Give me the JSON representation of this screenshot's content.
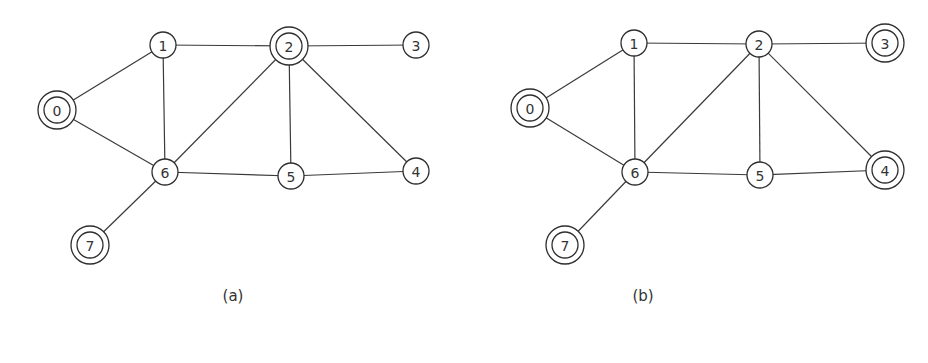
{
  "diagrams": [
    {
      "caption": "(a)",
      "caption_pos": [
        233,
        297
      ],
      "nodes": [
        {
          "id": "0",
          "x": 57,
          "y": 110,
          "double": true
        },
        {
          "id": "1",
          "x": 163,
          "y": 45,
          "double": false
        },
        {
          "id": "2",
          "x": 289,
          "y": 46,
          "double": true
        },
        {
          "id": "3",
          "x": 416,
          "y": 45,
          "double": false
        },
        {
          "id": "4",
          "x": 416,
          "y": 171,
          "double": false
        },
        {
          "id": "5",
          "x": 291,
          "y": 176,
          "double": false
        },
        {
          "id": "6",
          "x": 165,
          "y": 172,
          "double": false
        },
        {
          "id": "7",
          "x": 90,
          "y": 245,
          "double": true
        }
      ],
      "edges": [
        [
          "0",
          "1"
        ],
        [
          "0",
          "6"
        ],
        [
          "1",
          "2"
        ],
        [
          "1",
          "6"
        ],
        [
          "2",
          "3"
        ],
        [
          "2",
          "6"
        ],
        [
          "2",
          "5"
        ],
        [
          "2",
          "4"
        ],
        [
          "6",
          "5"
        ],
        [
          "5",
          "4"
        ],
        [
          "6",
          "7"
        ]
      ]
    },
    {
      "caption": "(b)",
      "caption_pos": [
        643,
        297
      ],
      "nodes": [
        {
          "id": "0",
          "x": 530,
          "y": 108,
          "double": true
        },
        {
          "id": "1",
          "x": 634,
          "y": 43,
          "double": false
        },
        {
          "id": "2",
          "x": 759,
          "y": 44,
          "double": false
        },
        {
          "id": "3",
          "x": 885,
          "y": 43,
          "double": true
        },
        {
          "id": "4",
          "x": 885,
          "y": 170,
          "double": true
        },
        {
          "id": "5",
          "x": 760,
          "y": 175,
          "double": false
        },
        {
          "id": "6",
          "x": 635,
          "y": 172,
          "double": false
        },
        {
          "id": "7",
          "x": 565,
          "y": 245,
          "double": true
        }
      ],
      "edges": [
        [
          "0",
          "1"
        ],
        [
          "0",
          "6"
        ],
        [
          "1",
          "2"
        ],
        [
          "1",
          "6"
        ],
        [
          "2",
          "3"
        ],
        [
          "2",
          "6"
        ],
        [
          "2",
          "5"
        ],
        [
          "2",
          "4"
        ],
        [
          "6",
          "5"
        ],
        [
          "5",
          "4"
        ],
        [
          "6",
          "7"
        ]
      ]
    }
  ],
  "style": {
    "inner_radius": 13,
    "outer_radius": 19,
    "stroke_color": "#2e2e2e"
  }
}
